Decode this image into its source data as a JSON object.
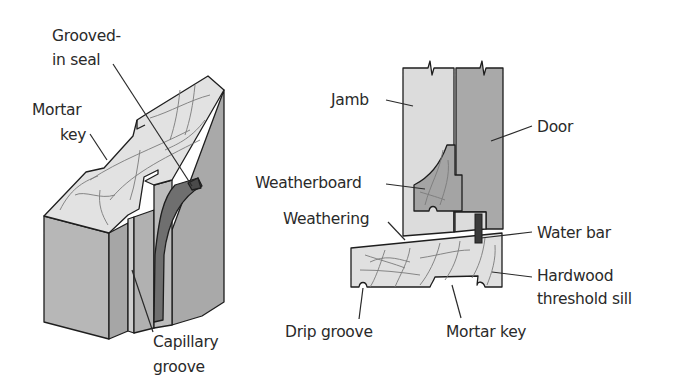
{
  "figure": {
    "left_view": {
      "title": "Isometric section of hardwood threshold sill",
      "labels": {
        "grooved_in_seal_line1": "Grooved-",
        "grooved_in_seal_line2": "in seal",
        "mortar_key_line1": "Mortar",
        "mortar_key_line2": "key",
        "capillary_groove_line1": "Capillary",
        "capillary_groove_line2": "groove"
      }
    },
    "right_view": {
      "title": "Cross-section of door threshold",
      "labels": {
        "jamb": "Jamb",
        "door": "Door",
        "weatherboard": "Weatherboard",
        "weathering": "Weathering",
        "water_bar": "Water bar",
        "hardwood_line1": "Hardwood",
        "hardwood_line2": "threshold sill",
        "drip_groove": "Drip groove",
        "mortar_key": "Mortar key"
      }
    },
    "colors": {
      "light_wood": "#dcdcdc",
      "top_face": "#e4e4e4",
      "side_face": "#b4b4b4",
      "door": "#a8a8a8",
      "weatherboard": "#a0a0a0",
      "seal": "#6e6e6e",
      "water_bar": "#3a3a3a",
      "outline": "#1e1e1e"
    }
  }
}
